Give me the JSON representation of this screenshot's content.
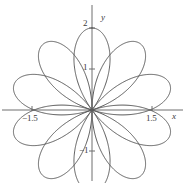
{
  "figure": {
    "width": 185,
    "height": 183,
    "background": "#ffffff",
    "curve_color": "#5a5a5a",
    "axis_color": "#6e6e6e",
    "text_color": "#3a3a3a"
  },
  "axes": {
    "x_name": "x",
    "y_name": "y",
    "origin_px": {
      "x": 92,
      "y": 110
    },
    "unit_px": 41
  },
  "ticks": {
    "x": [
      {
        "value": -1.5,
        "label": "−1.5"
      },
      {
        "value": 1.5,
        "label": "1.5"
      }
    ],
    "y": [
      {
        "value": 2,
        "label": "2"
      },
      {
        "value": 1,
        "label": "1"
      },
      {
        "value": -1,
        "label": "−1"
      }
    ]
  },
  "chart_data": {
    "type": "line",
    "title": "",
    "xlabel": "x",
    "ylabel": "y",
    "subtitle": "",
    "plot_kind": "polar-rose",
    "equation": "r = 2 cos(5θ/2)",
    "petal_count": 5,
    "max_radius": 2,
    "petal_tip_angles_deg": [
      90,
      162,
      234,
      306,
      18
    ],
    "grid": false,
    "legend": null,
    "xlim": [
      -2.2,
      2.2
    ],
    "ylim": [
      -1.75,
      2.2
    ],
    "xticks": [
      -1.5,
      1.5
    ],
    "yticks": [
      -1,
      1,
      2
    ],
    "series": [
      {
        "name": "r = 2 cos(5θ/2)",
        "coordinate_system": "polar",
        "theta_range_deg": [
          0,
          720
        ],
        "r_amplitude": 2,
        "r_frequency": 2.5,
        "color": "#5a5a5a",
        "linewidth": 1
      }
    ],
    "annotations": []
  }
}
